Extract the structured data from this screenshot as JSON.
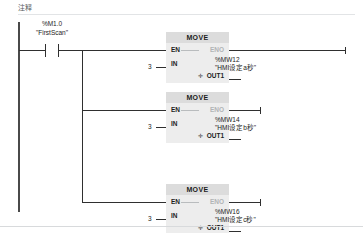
{
  "editor": {
    "network_comment": "注释"
  },
  "rung": {
    "contact": {
      "address": "%M1.0",
      "symbol": "\"FirstScan\"",
      "type": "normally-open-contact"
    }
  },
  "blocks": [
    {
      "title": "MOVE",
      "pin_en": "EN",
      "pin_eno": "ENO",
      "pin_in": "IN",
      "pin_out": "OUT1",
      "out_glyph": "✛",
      "in_value": "3",
      "out_address": "%MW12",
      "out_symbol": "\"HMI设定a秒\""
    },
    {
      "title": "MOVE",
      "pin_en": "EN",
      "pin_eno": "ENO",
      "pin_in": "IN",
      "pin_out": "OUT1",
      "out_glyph": "✛",
      "in_value": "3",
      "out_address": "%MW14",
      "out_symbol": "\"HMI设定b秒\""
    },
    {
      "title": "MOVE",
      "pin_en": "EN",
      "pin_eno": "ENO",
      "pin_in": "IN",
      "pin_out": "OUT1",
      "out_glyph": "✛",
      "in_value": "3",
      "out_address": "%MW16",
      "out_symbol": "\"HMI设定c秒\""
    }
  ],
  "colors": {
    "block_body": "#ededed",
    "block_header": "#dcdcdc",
    "wire": "#2f2f2f",
    "wire_dim": "#b9bcbe",
    "rail": "#4a4a4a",
    "background": "#ffffff"
  }
}
